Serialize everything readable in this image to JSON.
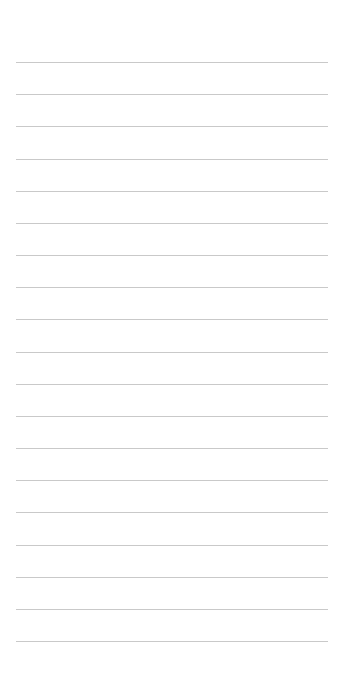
{
  "page": {
    "type": "lined-paper",
    "background": "#ffffff",
    "line_color": "#c9c9c9",
    "line_count": 19,
    "first_line_y": 62,
    "line_spacing": 32.17,
    "line_left": 16,
    "line_width": 312
  }
}
